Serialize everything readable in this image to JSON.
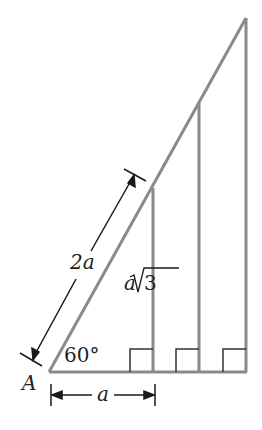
{
  "diagram": {
    "vertex_label": "A",
    "angle_label": "60°",
    "hypotenuse_label": "2a",
    "height_label_var": "a",
    "height_label_radical": "3",
    "base_label": "a",
    "line_color": "#8a8a8a",
    "annotation_color": "#1a1a1a"
  }
}
